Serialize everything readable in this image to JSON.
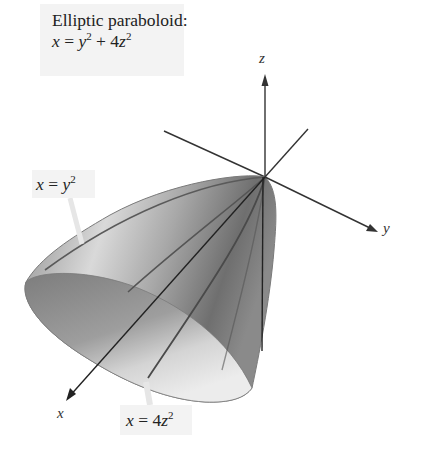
{
  "title": {
    "line1": "Elliptic paraboloid:",
    "equation_lhs": "x",
    "equation_eq": " = ",
    "equation_y": "y",
    "equation_y_exp": "2",
    "equation_plus": " + 4",
    "equation_z": "z",
    "equation_z_exp": "2"
  },
  "trace_labels": [
    {
      "lhs": "x",
      "eq": " = ",
      "var": "y",
      "coef": "",
      "exp": "2"
    },
    {
      "lhs": "x",
      "eq": " = ",
      "var": "z",
      "coef": "4",
      "exp": "2"
    }
  ],
  "axes": {
    "x": "x",
    "y": "y",
    "z": "z"
  },
  "colors": {
    "surface_dark": "#6e6e6e",
    "surface_mid": "#9a9a9a",
    "surface_light": "#d8d8d8",
    "opening_dark": "#7a7a7a",
    "opening_light": "#e6e6e6",
    "axis": "#333333",
    "label_bg": "#f3f3f3"
  }
}
